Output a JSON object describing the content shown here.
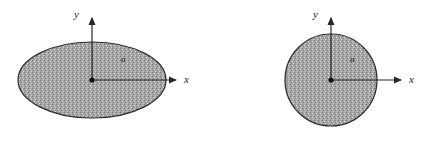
{
  "figure": {
    "background_color": "#ffffff",
    "width": 428,
    "height": 141,
    "stroke_color": "#262626",
    "fill_color": "#9a9a9a",
    "fill_pattern": "stipple-dots"
  },
  "panels": [
    {
      "id": "ellipse-panel",
      "shape_type": "ellipse",
      "region_label": "a",
      "x_axis_label": "x",
      "y_axis_label": "y",
      "origin_label": "",
      "geometry": {
        "center_x": 92,
        "center_y": 80,
        "radius_x": 74,
        "radius_y": 38,
        "x_axis_end": 178,
        "y_axis_end": 16
      }
    },
    {
      "id": "circle-panel",
      "shape_type": "circle",
      "region_label": "a",
      "x_axis_label": "x",
      "y_axis_label": "y",
      "origin_label": "",
      "geometry": {
        "center_x": 117,
        "center_y": 80,
        "radius_x": 46,
        "radius_y": 46,
        "x_axis_end": 189,
        "y_axis_end": 16
      }
    }
  ]
}
